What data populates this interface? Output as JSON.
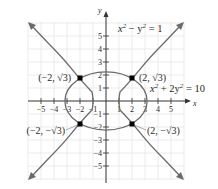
{
  "axes": {
    "x_label": "x",
    "y_label": "y",
    "x_ticks": [
      "−5",
      "−4",
      "−3",
      "−2",
      "−1",
      "1",
      "2",
      "3",
      "4",
      "5"
    ],
    "y_ticks": [
      "5",
      "4",
      "3",
      "2",
      "1",
      "−1",
      "−2",
      "−3",
      "−4",
      "−5"
    ]
  },
  "curves": {
    "hyperbola": {
      "equation_lhs": "x",
      "equation_mid": " − y",
      "equation_rhs": " = 1",
      "label": "x² − y² = 1"
    },
    "ellipse": {
      "equation_lhs": "x",
      "equation_mid": " + 2y",
      "equation_rhs": " = 10",
      "label": "x² + 2y² = 10"
    }
  },
  "points": [
    {
      "label": "(−2, √3)",
      "x": -2,
      "y": 1.732
    },
    {
      "label": "(2, √3)",
      "x": 2,
      "y": 1.732
    },
    {
      "label": "(−2, −√3)",
      "x": -2,
      "y": -1.732
    },
    {
      "label": "(2, −√3)",
      "x": 2,
      "y": -1.732
    }
  ],
  "colors": {
    "curve": "#6b6b6b",
    "axis": "#333333",
    "grid": "#e4e4e4",
    "point": "#000000"
  }
}
